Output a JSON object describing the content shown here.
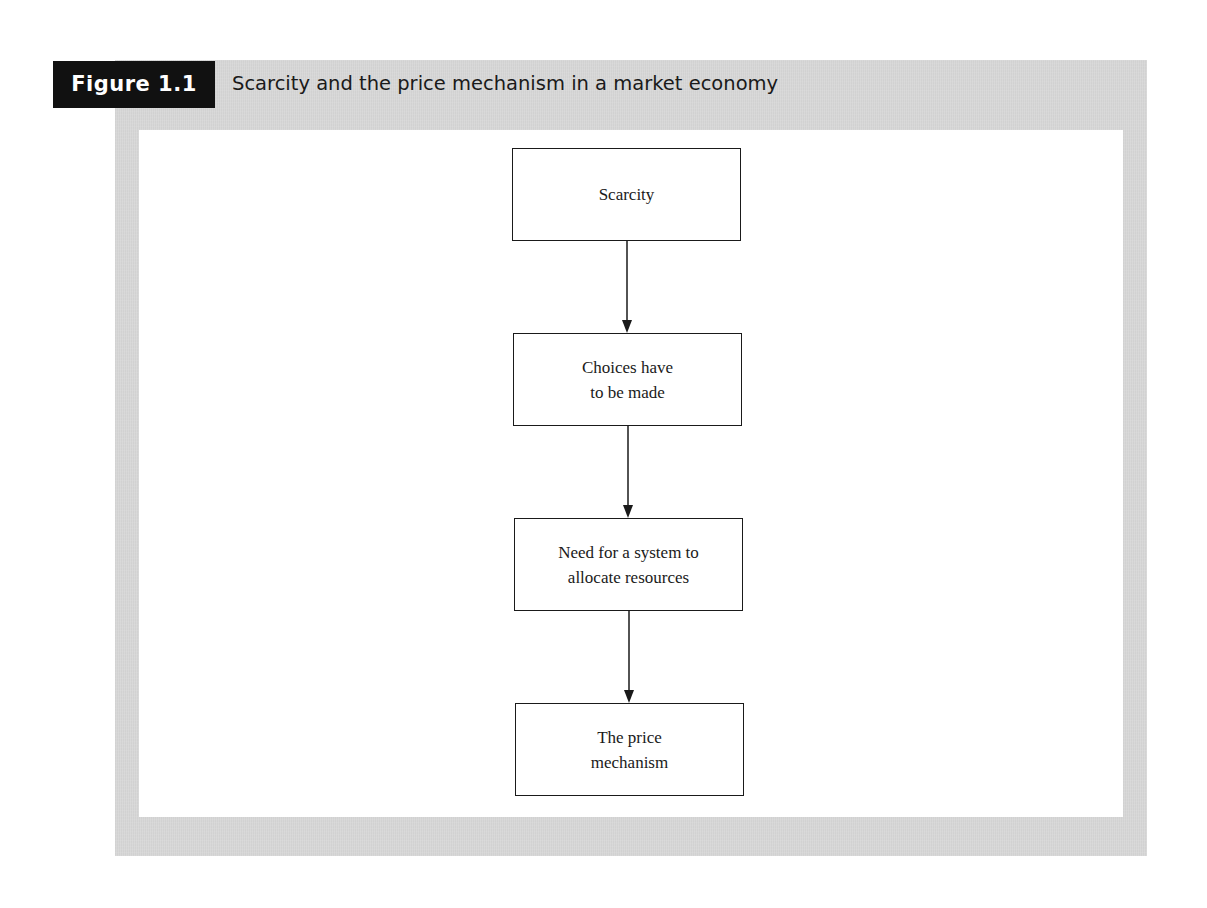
{
  "figure": {
    "label": "Figure 1.1",
    "title": "Scarcity and the price mechanism in a market economy",
    "colors": {
      "label_bg": "#111111",
      "label_text": "#ffffff",
      "panel_bg": "#d8d8d8",
      "inner_bg": "#ffffff",
      "stroke": "#1a1a1a"
    }
  },
  "flowchart": {
    "direction": "top-to-bottom",
    "nodes": [
      {
        "id": "scarcity",
        "label": "Scarcity"
      },
      {
        "id": "choices",
        "label": "Choices have\nto be made"
      },
      {
        "id": "system",
        "label": "Need for a system to\nallocate resources"
      },
      {
        "id": "price",
        "label": "The price\nmechanism"
      }
    ],
    "edges": [
      {
        "from": "scarcity",
        "to": "choices"
      },
      {
        "from": "choices",
        "to": "system"
      },
      {
        "from": "system",
        "to": "price"
      }
    ]
  }
}
